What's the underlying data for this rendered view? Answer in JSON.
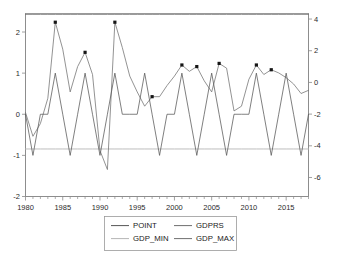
{
  "chart_data": {
    "type": "line",
    "title": "",
    "subtitle": "",
    "xlabel": "",
    "ylabel": "",
    "grid": false,
    "legend_position": "bottom-center",
    "x": [
      1980,
      1981,
      1982,
      1983,
      1984,
      1985,
      1986,
      1987,
      1988,
      1989,
      1990,
      1991,
      1992,
      1993,
      1994,
      1995,
      1996,
      1997,
      1998,
      1999,
      2000,
      2001,
      2002,
      2003,
      2004,
      2005,
      2006,
      2007,
      2008,
      2009,
      2010,
      2011,
      2012,
      2013,
      2014,
      2015,
      2016,
      2017,
      2018
    ],
    "xticklabels": [
      "1980",
      "1985",
      "1990",
      "1995",
      "2000",
      "2005",
      "2010",
      "2015"
    ],
    "xticks": [
      1980,
      1985,
      1990,
      1995,
      2000,
      2005,
      2010,
      2015
    ],
    "xlim": [
      1980,
      2018
    ],
    "left_axis": {
      "ticks": [
        -2,
        -1,
        0,
        1,
        2
      ],
      "ticklabels": [
        "-2",
        "-1",
        "0",
        "1",
        "2"
      ],
      "ylim": [
        -2,
        2.45
      ]
    },
    "right_axis": {
      "ticks": [
        -6,
        -4,
        -2,
        0,
        2,
        4
      ],
      "ticklabels": [
        "-6",
        "-4",
        "-2",
        "0",
        "2",
        "4"
      ],
      "ylim": [
        -7.2,
        4.35
      ]
    },
    "series": [
      {
        "name": "POINT",
        "axis": "left",
        "color": "#555555",
        "marker": "none",
        "values": [
          0,
          -1,
          0,
          0,
          1,
          0,
          -1,
          0,
          1,
          0,
          -1,
          0,
          1,
          0,
          0,
          0,
          1,
          0,
          -1,
          0,
          0,
          1,
          0,
          -1,
          0,
          1,
          0,
          -1,
          0,
          0,
          0,
          1,
          0,
          -1,
          0,
          1,
          0,
          -1,
          0
        ]
      },
      {
        "name": "GDPRS",
        "axis": "right",
        "color": "#6f6f6f",
        "marker": "square",
        "values": [
          -1.9,
          -3.4,
          -2.6,
          -1.0,
          3.8,
          2.1,
          -0.6,
          1.0,
          1.9,
          0.5,
          -4.3,
          -5.5,
          3.8,
          2.2,
          0.4,
          -0.6,
          -1.5,
          -0.9,
          -0.9,
          -0.2,
          0.4,
          1.1,
          0.7,
          1.0,
          0.1,
          -0.6,
          1.2,
          0.9,
          -1.8,
          -1.5,
          0.2,
          1.1,
          0.5,
          0.8,
          0.6,
          0.3,
          -0.1,
          -0.7,
          -0.5
        ]
      },
      {
        "name": "GDP_MIN",
        "axis": "right",
        "color": "#b5b5b5",
        "marker": "none",
        "values": [
          -4.2,
          -4.2,
          -4.2,
          -4.2,
          -4.2,
          -4.2,
          -4.2,
          -4.2,
          -4.2,
          -4.2,
          -4.2,
          -4.2,
          -4.2,
          -4.2,
          -4.2,
          -4.2,
          -4.2,
          -4.2,
          -4.2,
          -4.2,
          -4.2,
          -4.2,
          -4.2,
          -4.2,
          -4.2,
          -4.2,
          -4.2,
          -4.2,
          -4.2,
          -4.2,
          -4.2,
          -4.2,
          -4.2,
          -4.2,
          -4.2,
          -4.2,
          -4.2,
          -4.2,
          -4.2
        ]
      },
      {
        "name": "GDP_MAX",
        "axis": "right",
        "color": "#707070",
        "marker": "none",
        "values": [
          4.3,
          4.3,
          4.3,
          4.3,
          4.3,
          4.3,
          4.3,
          4.3,
          4.3,
          4.3,
          4.3,
          4.3,
          4.3,
          4.3,
          4.3,
          4.3,
          4.3,
          4.3,
          4.3,
          4.3,
          4.3,
          4.3,
          4.3,
          4.3,
          4.3,
          4.3,
          4.3,
          4.3,
          4.3,
          4.3,
          4.3,
          4.3,
          4.3,
          4.3,
          4.3,
          4.3,
          4.3,
          4.3,
          4.3
        ]
      }
    ],
    "marker_points": {
      "series": "GDPRS",
      "x": [
        1984,
        1988,
        1992,
        1997,
        2001,
        2003,
        2006,
        2011,
        2013
      ],
      "y": [
        3.8,
        1.9,
        3.8,
        -0.9,
        1.1,
        1.0,
        1.2,
        1.1,
        0.8
      ]
    }
  },
  "legend": {
    "entries": [
      {
        "label": "POINT",
        "color": "#555555"
      },
      {
        "label": "GDPRS",
        "color": "#6f6f6f"
      },
      {
        "label": "GDP_MIN",
        "color": "#b5b5b5"
      },
      {
        "label": "GDP_MAX",
        "color": "#707070"
      }
    ]
  },
  "colors": {
    "background": "#ffffff",
    "axis": "#8a8a8a",
    "frame": "#9a9a9a",
    "text": "#1a1a1a"
  }
}
